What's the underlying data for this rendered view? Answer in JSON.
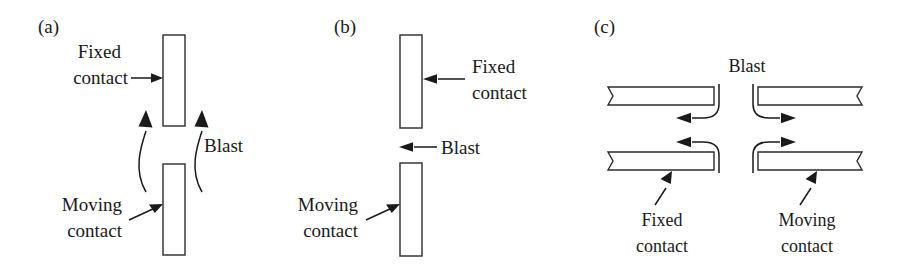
{
  "figure": {
    "background_color": "#ffffff",
    "line_color": "#1a1a1a",
    "bar_fill_color": "#ffffff",
    "bar_stroke_color": "#2b2b2b"
  },
  "panels": [
    {
      "id": "a",
      "label": "(a)",
      "description": "Axial blast: vertical contacts with blast flowing upward along both sides of the gap",
      "labels": {
        "fixed_line1": "Fixed",
        "fixed_line2": "contact",
        "moving_line1": "Moving",
        "moving_line2": "contact",
        "blast": "Blast"
      }
    },
    {
      "id": "b",
      "label": "(b)",
      "description": "Cross blast: vertical contacts with blast flowing horizontally to the left across the gap",
      "labels": {
        "fixed_line1": "Fixed",
        "fixed_line2": "contact",
        "moving_line1": "Moving",
        "moving_line2": "contact",
        "blast": "Blast"
      }
    },
    {
      "id": "c",
      "label": "(c)",
      "description": "Radial blast: horizontal contact pairs with blast entering the central gap and flowing outward to both sides",
      "labels": {
        "blast": "Blast",
        "fixed_line1": "Fixed",
        "fixed_line2": "contact",
        "moving_line1": "Moving",
        "moving_line2": "contact"
      }
    }
  ]
}
